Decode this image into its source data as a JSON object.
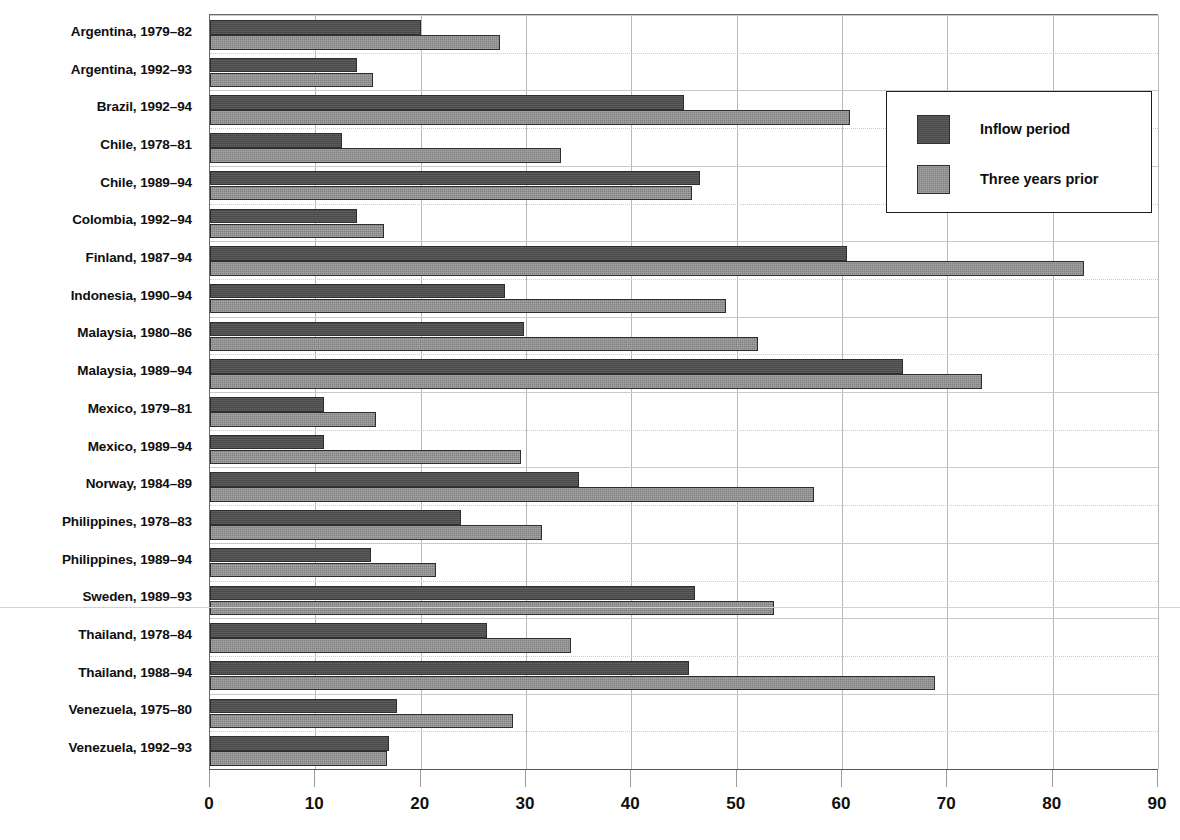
{
  "chart_data": {
    "type": "bar",
    "orientation": "horizontal",
    "title": "",
    "subtitle": "",
    "xlabel": "",
    "ylabel": "",
    "xlim": [
      0,
      90
    ],
    "xticks": [
      0,
      10,
      20,
      30,
      40,
      50,
      60,
      70,
      80,
      90
    ],
    "grid": "vertical-and-horizontal",
    "legend_position": "top-right",
    "categories": [
      "Argentina, 1979–82",
      "Argentina, 1992–93",
      "Brazil, 1992–94",
      "Chile, 1978–81",
      "Chile, 1989–94",
      "Colombia, 1992–94",
      "Finland, 1987–94",
      "Indonesia, 1990–94",
      "Malaysia, 1980–86",
      "Malaysia, 1989–94",
      "Mexico, 1979–81",
      "Mexico, 1989–94",
      "Norway, 1984–89",
      "Philippines, 1978–83",
      "Philippines, 1989–94",
      "Sweden, 1989–93",
      "Thailand, 1978–84",
      "Thailand, 1988–94",
      "Venezuela, 1975–80",
      "Venezuela, 1992–93"
    ],
    "series": [
      {
        "name": "Inflow period",
        "color": "#4a4a4a",
        "values": [
          20.0,
          14.0,
          45.0,
          12.5,
          46.5,
          14.0,
          60.5,
          28.0,
          29.8,
          65.8,
          10.8,
          10.8,
          35.0,
          23.8,
          15.3,
          46.0,
          26.3,
          45.5,
          17.8,
          17.0
        ]
      },
      {
        "name": "Three years prior",
        "color": "#818181",
        "values": [
          27.5,
          15.5,
          60.8,
          33.3,
          45.8,
          16.5,
          83.0,
          49.0,
          52.0,
          73.3,
          15.8,
          29.5,
          57.3,
          31.5,
          21.5,
          53.5,
          34.3,
          68.8,
          28.8,
          16.8
        ]
      }
    ]
  },
  "legend": {
    "entries": [
      {
        "label": "Inflow period",
        "swatch": "inflow"
      },
      {
        "label": "Three years prior",
        "swatch": "prior"
      }
    ]
  },
  "artifacts": {
    "top_text": "",
    "bottom_text": ""
  }
}
